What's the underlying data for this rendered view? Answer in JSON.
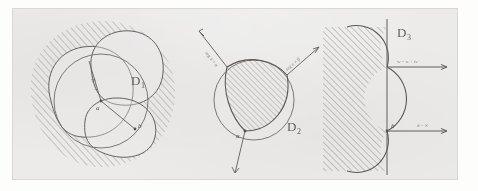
{
  "figure": {
    "medium": "pencil drawing on paper (photocopy/scan)",
    "background_color": "#f0efed",
    "ink_color": "#5d5a55",
    "hatch_color": "#8c8980",
    "panel_count": 3
  },
  "panels": [
    {
      "id": "panel-1",
      "domain_label": "D",
      "domain_subscript": "1",
      "description": "Three overlapping closed convex curves (petal/leaf shapes) forming a compound region; the exterior is hatched.",
      "hatching": {
        "region": "exterior",
        "direction": "diagonal-up-right",
        "color": "#8c8980"
      },
      "annotations": [
        {
          "name": "radius-label",
          "text": "R = r",
          "style": "rotated-handwritten"
        },
        {
          "name": "center-point-label",
          "text": "a"
        },
        {
          "name": "boundary-point-label",
          "text": "b"
        }
      ],
      "shapes": [
        {
          "name": "outer-lobe-left",
          "type": "closed-curve"
        },
        {
          "name": "outer-lobe-upper-right",
          "type": "closed-curve"
        },
        {
          "name": "outer-lobe-lower-right",
          "type": "closed-curve"
        },
        {
          "name": "inner-circle",
          "type": "circle"
        },
        {
          "name": "radius-segment",
          "type": "line",
          "from": "a",
          "to": "b"
        }
      ]
    },
    {
      "id": "panel-2",
      "domain_label": "D",
      "domain_subscript": "2",
      "description": "A circle with an inscribed curvilinear (Reuleaux-like) triangle whose interior is hatched; three rays emanate outward through the triangle vertices.",
      "hatching": {
        "region": "interior-triangle",
        "direction": "diagonal-up-right",
        "color": "#8c8980"
      },
      "annotations": [
        {
          "name": "ray-label-upper-left",
          "text": "arg z = α"
        },
        {
          "name": "ray-label-upper-right",
          "text": "arg z = β"
        },
        {
          "name": "vertex-point-label",
          "text": "a"
        }
      ],
      "shapes": [
        {
          "name": "bounding-circle",
          "type": "circle"
        },
        {
          "name": "curvilinear-triangle",
          "type": "closed-curve"
        },
        {
          "name": "ray-upper-left",
          "type": "arrow"
        },
        {
          "name": "ray-upper-right",
          "type": "arrow"
        },
        {
          "name": "ray-lower",
          "type": "arrow"
        }
      ]
    },
    {
      "id": "panel-3",
      "domain_label": "D",
      "domain_subscript": "3",
      "description": "A vertical straight boundary line with a hatched half-plane region at left, bounded by two circular arcs bulging rightward; two horizontal arrows point to the right from the line.",
      "hatching": {
        "region": "left-half-plane",
        "direction": "diagonal-up-right",
        "color": "#8c8980"
      },
      "annotations": [
        {
          "name": "upper-arrow-label",
          "text": "w = u + iv"
        },
        {
          "name": "lower-arrow-label",
          "text": "d = ∞"
        },
        {
          "name": "origin-point-label",
          "text": "b"
        }
      ],
      "shapes": [
        {
          "name": "vertical-axis",
          "type": "line"
        },
        {
          "name": "arc-upper",
          "type": "arc"
        },
        {
          "name": "arc-middle",
          "type": "arc"
        },
        {
          "name": "arc-lower",
          "type": "arc"
        },
        {
          "name": "arrow-upper",
          "type": "arrow"
        },
        {
          "name": "arrow-lower",
          "type": "arrow"
        }
      ]
    }
  ]
}
